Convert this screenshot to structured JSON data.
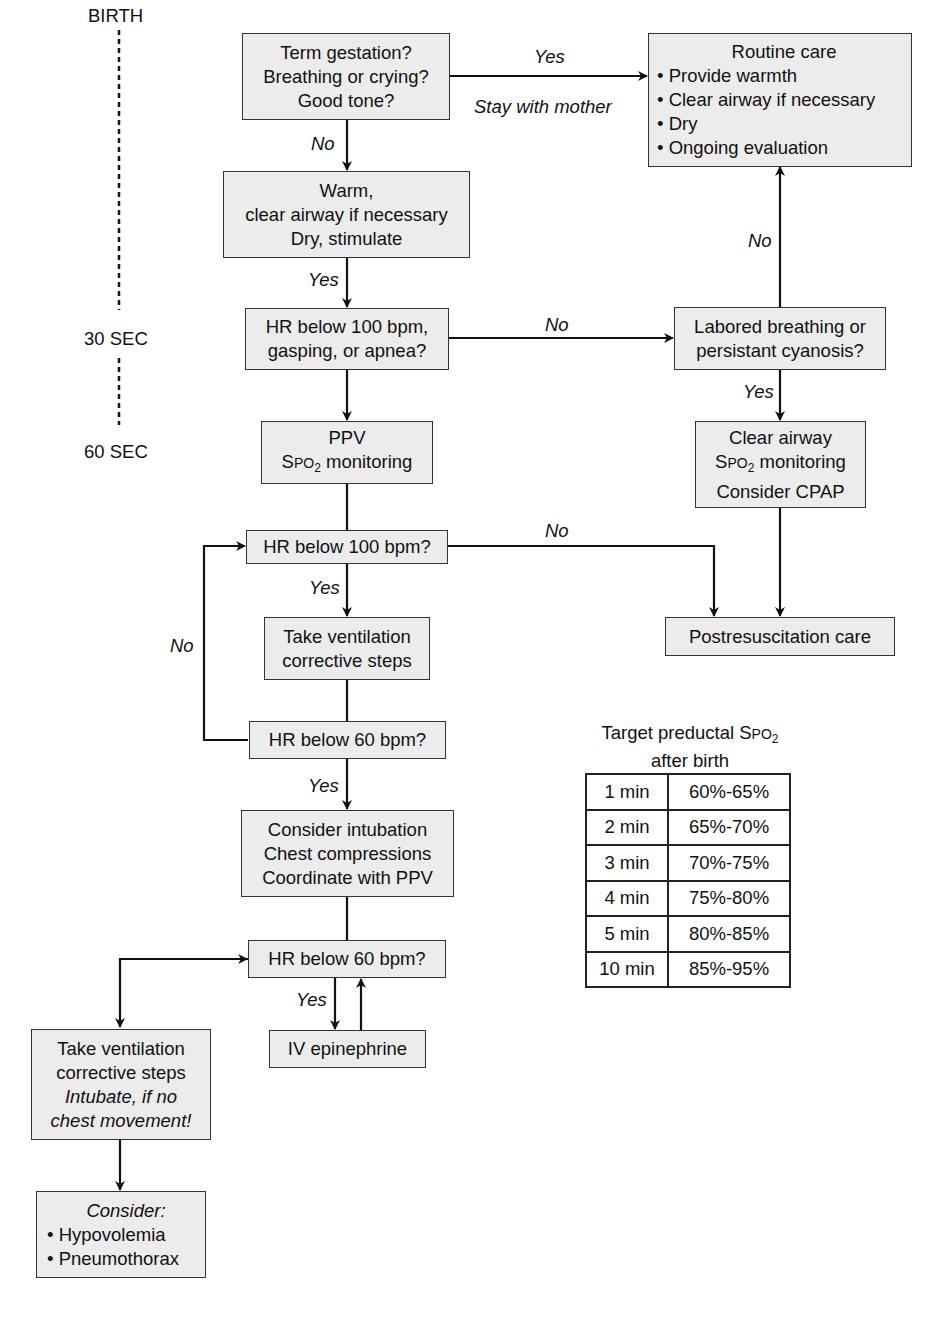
{
  "timeline": {
    "birth": "BIRTH",
    "t30": "30 SEC",
    "t60": "60 SEC"
  },
  "nodes": {
    "initial_assessment": [
      "Term gestation?",
      "Breathing or crying?",
      "Good tone?"
    ],
    "routine_care": {
      "title": "Routine care",
      "items": [
        "Provide warmth",
        "Clear airway if necessary",
        "Dry",
        "Ongoing evaluation"
      ]
    },
    "warm_clear": [
      "Warm,",
      "clear airway if necessary",
      "Dry, stimulate"
    ],
    "hr_gasping": [
      "HR below 100 bpm,",
      "gasping, or apnea?"
    ],
    "labored": [
      "Labored breathing or",
      "persistant cyanosis?"
    ],
    "ppv": {
      "line1": "PPV",
      "spo2_prefix": "S",
      "spo2_po": "PO",
      "spo2_sub": "2",
      "spo2_suffix": " monitoring"
    },
    "clear_airway": {
      "line1": "Clear airway",
      "spo2_prefix": "S",
      "spo2_po": "PO",
      "spo2_sub": "2",
      "spo2_suffix": " monitoring",
      "line3": "Consider CPAP"
    },
    "hr100": "HR below 100 bpm?",
    "postresus": "Postresuscitation care",
    "vent_steps": [
      "Take ventilation",
      "corrective steps"
    ],
    "hr60_a": "HR below 60 bpm?",
    "intubation": [
      "Consider intubation",
      "Chest compressions",
      "Coordinate with PPV"
    ],
    "hr60_b": "HR below 60 bpm?",
    "iv_epi": "IV epinephrine",
    "vent_steps_2": {
      "lines": [
        "Take ventilation",
        "corrective steps"
      ],
      "italic_lines": [
        "Intubate, if no",
        "chest movement!"
      ]
    },
    "consider": {
      "title": "Consider:",
      "items": [
        "Hypovolemia",
        "Pneumothorax"
      ]
    }
  },
  "edge_labels": {
    "yes_routine": "Yes",
    "stay_mother": "Stay with mother",
    "no_warm": "No",
    "yes_hr": "Yes",
    "no_labored": "No",
    "no_routine": "No",
    "yes_clear": "Yes",
    "no_post": "No",
    "yes_vent": "Yes",
    "no_loop": "No",
    "yes_intub": "Yes",
    "yes_epi": "Yes"
  },
  "spo2_table": {
    "caption_prefix": "Target preductal S",
    "caption_po": "PO",
    "caption_sub": "2",
    "caption_line2": "after birth",
    "rows": [
      {
        "time": "1 min",
        "range": "60%-65%"
      },
      {
        "time": "2 min",
        "range": "65%-70%"
      },
      {
        "time": "3 min",
        "range": "70%-75%"
      },
      {
        "time": "4 min",
        "range": "75%-80%"
      },
      {
        "time": "5 min",
        "range": "80%-85%"
      },
      {
        "time": "10 min",
        "range": "85%-95%"
      }
    ]
  }
}
